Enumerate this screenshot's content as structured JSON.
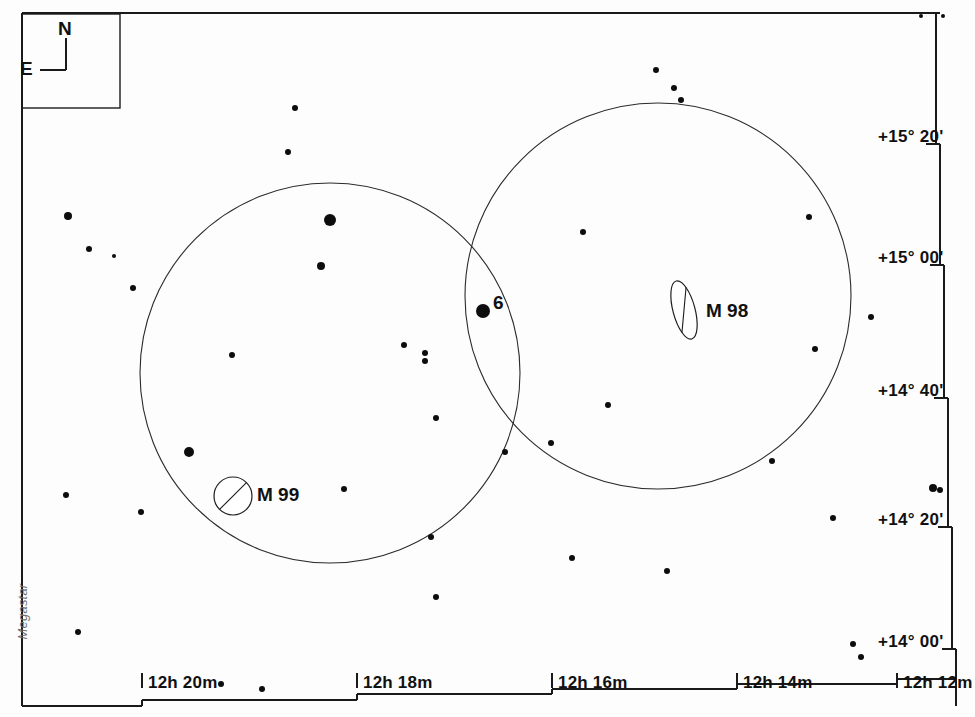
{
  "chart_data": {
    "type": "scatter",
    "xlabel": "Right Ascension",
    "ylabel": "Declination",
    "grid": false,
    "legend": "none",
    "projection": "equatorial",
    "watermark": "Megastar",
    "axis_ra": {
      "ticks": [
        "12h 20m",
        "12h 18m",
        "12h 16m",
        "12h 14m",
        "12h 12m"
      ],
      "tick_x": [
        150,
        365,
        560,
        745,
        905
      ],
      "direction": "right-ascension decreases to the right"
    },
    "axis_dec": {
      "ticks": [
        "+15° 20'",
        "+15° 00'",
        "+14° 40'",
        "+14° 20'",
        "+14° 00'"
      ],
      "tick_y": [
        136,
        257,
        390,
        519,
        641
      ],
      "direction": "declination increases upward"
    },
    "compass": {
      "north_label": "N",
      "east_label": "E"
    },
    "field_circles": [
      {
        "name": "eyepiece-field-left",
        "cx": 330,
        "cy": 373,
        "r": 190
      },
      {
        "name": "eyepiece-field-right",
        "cx": 658,
        "cy": 296,
        "r": 193
      }
    ],
    "deep_sky_objects": [
      {
        "label": "M 98",
        "kind": "edge-on-galaxy",
        "shape": "ellipse",
        "cx": 684,
        "cy": 310,
        "rx": 11,
        "ry": 30,
        "rotation": -15,
        "label_x": 706,
        "label_y": 300
      },
      {
        "label": "M 99",
        "kind": "face-on-galaxy",
        "shape": "circle-with-slash",
        "cx": 233,
        "cy": 496,
        "rx": 19,
        "ry": 19,
        "rotation": 0,
        "label_x": 257,
        "label_y": 484
      }
    ],
    "labeled_stars": [
      {
        "label": "6",
        "x": 483,
        "y": 311,
        "r": 7,
        "label_x": 493,
        "label_y": 292
      }
    ],
    "stars": [
      {
        "x": 295,
        "y": 108,
        "r": 3
      },
      {
        "x": 288,
        "y": 152,
        "r": 3
      },
      {
        "x": 656,
        "y": 70,
        "r": 3
      },
      {
        "x": 674,
        "y": 88,
        "r": 3
      },
      {
        "x": 681,
        "y": 100,
        "r": 3
      },
      {
        "x": 68,
        "y": 216,
        "r": 4
      },
      {
        "x": 89,
        "y": 249,
        "r": 3
      },
      {
        "x": 114,
        "y": 256,
        "r": 2
      },
      {
        "x": 133,
        "y": 288,
        "r": 3
      },
      {
        "x": 330,
        "y": 220,
        "r": 6
      },
      {
        "x": 321,
        "y": 266,
        "r": 4
      },
      {
        "x": 583,
        "y": 232,
        "r": 3
      },
      {
        "x": 809,
        "y": 217,
        "r": 3
      },
      {
        "x": 871,
        "y": 317,
        "r": 3
      },
      {
        "x": 232,
        "y": 355,
        "r": 3
      },
      {
        "x": 404,
        "y": 345,
        "r": 3
      },
      {
        "x": 425,
        "y": 353,
        "r": 3
      },
      {
        "x": 425,
        "y": 361,
        "r": 3
      },
      {
        "x": 608,
        "y": 405,
        "r": 3
      },
      {
        "x": 815,
        "y": 349,
        "r": 3
      },
      {
        "x": 436,
        "y": 418,
        "r": 3
      },
      {
        "x": 189,
        "y": 452,
        "r": 5
      },
      {
        "x": 505,
        "y": 452,
        "r": 3
      },
      {
        "x": 551,
        "y": 443,
        "r": 3
      },
      {
        "x": 772,
        "y": 461,
        "r": 3
      },
      {
        "x": 66,
        "y": 495,
        "r": 3
      },
      {
        "x": 141,
        "y": 512,
        "r": 3
      },
      {
        "x": 344,
        "y": 489,
        "r": 3
      },
      {
        "x": 833,
        "y": 518,
        "r": 3
      },
      {
        "x": 933,
        "y": 488,
        "r": 4
      },
      {
        "x": 940,
        "y": 490,
        "r": 3
      },
      {
        "x": 431,
        "y": 537,
        "r": 3
      },
      {
        "x": 572,
        "y": 558,
        "r": 3
      },
      {
        "x": 667,
        "y": 571,
        "r": 3
      },
      {
        "x": 436,
        "y": 597,
        "r": 3
      },
      {
        "x": 78,
        "y": 632,
        "r": 3
      },
      {
        "x": 853,
        "y": 644,
        "r": 3
      },
      {
        "x": 861,
        "y": 657,
        "r": 3
      },
      {
        "x": 221,
        "y": 684,
        "r": 3
      },
      {
        "x": 262,
        "y": 689,
        "r": 3
      },
      {
        "x": 921,
        "y": 16,
        "r": 2
      },
      {
        "x": 943,
        "y": 16,
        "r": 2
      }
    ]
  },
  "frame": {
    "border_color": "#1a1a1a"
  }
}
